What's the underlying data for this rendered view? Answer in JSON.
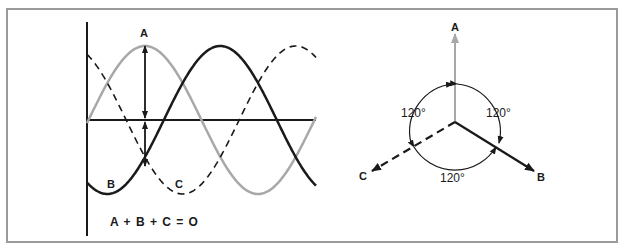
{
  "waveform": {
    "label_a": "A",
    "label_b": "B",
    "label_c": "C",
    "equation": "A + B + C = O"
  },
  "phasor": {
    "label_a": "A",
    "label_b": "B",
    "label_c": "C",
    "angle_left": "120°",
    "angle_right": "120°",
    "angle_bottom": "120°"
  },
  "colors": {
    "phase_a": "#a8a8a8",
    "phase_b": "#1a1a1a",
    "phase_c": "#1a1a1a",
    "frame": "#9a9a9a"
  }
}
